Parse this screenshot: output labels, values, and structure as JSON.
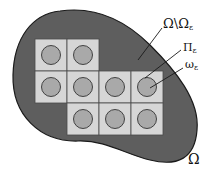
{
  "diagram": {
    "colors": {
      "domain_fill": "#5e5e5e",
      "domain_stroke": "#1a1a1a",
      "cell_fill": "#d6d6d6",
      "cell_stroke": "#4a4a4a",
      "inclusion_fill": "#a9a9a9",
      "inclusion_stroke": "#333333",
      "leader_line": "#1a1a1a"
    },
    "labels": {
      "outer_domain": {
        "main": "Ω",
        "sub": ""
      },
      "complement": {
        "main": "Ω\\Ω",
        "sub": "ε"
      },
      "cell_region": {
        "main": "Π",
        "sub": "ε"
      },
      "inclusion": {
        "main": "ω",
        "sub": "ε"
      }
    },
    "grid": {
      "cell_size": 32,
      "origin": [
        35,
        39
      ],
      "cells": [
        [
          0,
          0
        ],
        [
          1,
          0
        ],
        [
          0,
          1
        ],
        [
          1,
          1
        ],
        [
          2,
          1
        ],
        [
          3,
          1
        ],
        [
          1,
          2
        ],
        [
          2,
          2
        ],
        [
          3,
          2
        ]
      ],
      "inclusion_radius": 9.5
    }
  }
}
